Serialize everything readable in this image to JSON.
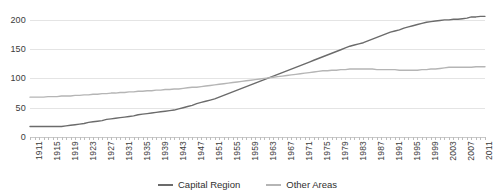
{
  "chart_data": {
    "type": "line",
    "title": "",
    "xlabel": "",
    "ylabel": "",
    "ylim": [
      0,
      210
    ],
    "yticks": [
      0,
      50,
      100,
      150,
      200
    ],
    "grid": true,
    "legend_position": "bottom",
    "x": [
      1911,
      1912,
      1913,
      1914,
      1915,
      1916,
      1917,
      1918,
      1919,
      1920,
      1921,
      1922,
      1923,
      1924,
      1925,
      1926,
      1927,
      1928,
      1929,
      1930,
      1931,
      1932,
      1933,
      1934,
      1935,
      1936,
      1937,
      1938,
      1939,
      1940,
      1941,
      1942,
      1943,
      1944,
      1945,
      1946,
      1947,
      1948,
      1949,
      1950,
      1951,
      1952,
      1953,
      1954,
      1955,
      1956,
      1957,
      1958,
      1959,
      1960,
      1961,
      1962,
      1963,
      1964,
      1965,
      1966,
      1967,
      1968,
      1969,
      1970,
      1971,
      1972,
      1973,
      1974,
      1975,
      1976,
      1977,
      1978,
      1979,
      1980,
      1981,
      1982,
      1983,
      1984,
      1985,
      1986,
      1987,
      1988,
      1989,
      1990,
      1991,
      1992,
      1993,
      1994,
      1995,
      1996,
      1997,
      1998,
      1999,
      2000,
      2001,
      2002,
      2003,
      2004,
      2005,
      2006,
      2007,
      2008,
      2009,
      2010,
      2011,
      2012
    ],
    "xtick_labels": [
      "1911",
      "1915",
      "1919",
      "1923",
      "1927",
      "1931",
      "1935",
      "1939",
      "1943",
      "1947",
      "1951",
      "1955",
      "1959",
      "1963",
      "1967",
      "1971",
      "1975",
      "1979",
      "1983",
      "1987",
      "1991",
      "1995",
      "1999",
      "2003",
      "2007",
      "2011"
    ],
    "xtick_values": [
      1911,
      1915,
      1919,
      1923,
      1927,
      1931,
      1935,
      1939,
      1943,
      1947,
      1951,
      1955,
      1959,
      1963,
      1967,
      1971,
      1975,
      1979,
      1983,
      1987,
      1991,
      1995,
      1999,
      2003,
      2007,
      2011
    ],
    "series": [
      {
        "name": "Capital Region",
        "color": "#6b6b6b",
        "values": [
          18,
          18,
          18,
          18,
          18,
          18,
          18,
          18,
          19,
          20,
          21,
          22,
          23,
          25,
          26,
          27,
          28,
          30,
          31,
          32,
          33,
          34,
          35,
          36,
          38,
          39,
          40,
          41,
          42,
          43,
          44,
          45,
          46,
          48,
          50,
          52,
          54,
          57,
          59,
          61,
          63,
          65,
          68,
          71,
          74,
          77,
          80,
          83,
          86,
          89,
          92,
          95,
          98,
          101,
          104,
          107,
          110,
          113,
          116,
          119,
          122,
          125,
          128,
          131,
          134,
          137,
          140,
          143,
          146,
          149,
          152,
          155,
          157,
          159,
          161,
          164,
          167,
          170,
          173,
          176,
          179,
          181,
          183,
          186,
          188,
          190,
          192,
          194,
          196,
          197,
          198,
          199,
          200,
          200,
          201,
          201,
          202,
          203,
          205,
          205,
          206,
          206
        ]
      },
      {
        "name": "Other Areas",
        "color": "#b5b5b5",
        "values": [
          68,
          68,
          68,
          68,
          69,
          69,
          69,
          70,
          70,
          70,
          71,
          71,
          72,
          72,
          73,
          73,
          74,
          74,
          75,
          75,
          76,
          76,
          77,
          77,
          78,
          78,
          79,
          79,
          80,
          80,
          81,
          81,
          82,
          82,
          83,
          84,
          85,
          85,
          86,
          87,
          88,
          89,
          90,
          91,
          92,
          93,
          94,
          95,
          96,
          97,
          98,
          99,
          100,
          101,
          102,
          103,
          104,
          105,
          106,
          107,
          108,
          109,
          110,
          111,
          112,
          113,
          113,
          114,
          114,
          115,
          115,
          116,
          116,
          116,
          116,
          116,
          116,
          115,
          115,
          115,
          115,
          115,
          114,
          114,
          114,
          114,
          114,
          115,
          115,
          116,
          116,
          117,
          118,
          119,
          119,
          119,
          119,
          119,
          119,
          120,
          120,
          120
        ]
      }
    ]
  },
  "legend": {
    "items": [
      {
        "label": "Capital Region",
        "color": "#6b6b6b"
      },
      {
        "label": "Other Areas",
        "color": "#b5b5b5"
      }
    ]
  }
}
